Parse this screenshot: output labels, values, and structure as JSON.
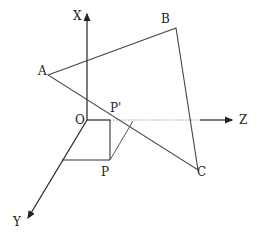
{
  "diagram": {
    "type": "3d-coordinate-geometry",
    "axes": {
      "x_label": "X",
      "y_label": "Y",
      "z_label": "Z",
      "origin_label": "O"
    },
    "triangle": {
      "vertices": [
        "A",
        "B",
        "C"
      ]
    },
    "points": {
      "p_label": "P",
      "p_prime_label": "P'"
    },
    "colors": {
      "line": "#444444",
      "axis": "#222222",
      "dotted": "#999999"
    }
  }
}
